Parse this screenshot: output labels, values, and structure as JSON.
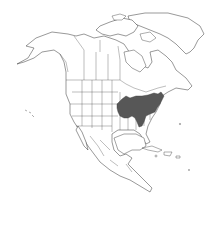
{
  "map": {
    "type": "species-range-map",
    "region": "North America",
    "projection": "orthographic-like",
    "range_fill_color": "#575757",
    "land_fill_color": "#ffffff",
    "outline_color": "#333333",
    "background_color": "#ffffff",
    "range_description": "Eastern United States (Midwest to Mid-Atlantic, south to Tennessee/Georgia)",
    "labels": []
  }
}
